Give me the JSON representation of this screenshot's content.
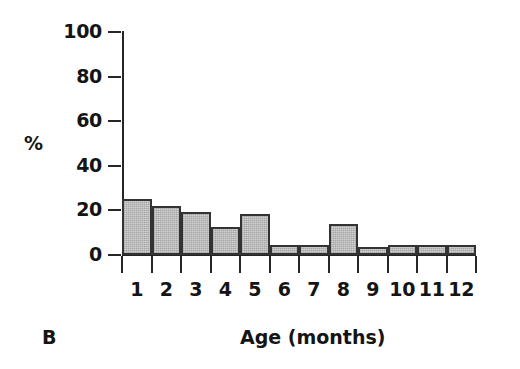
{
  "chart_data": {
    "type": "bar",
    "title": "",
    "panel_label": "B",
    "xlabel": "Age (months)",
    "ylabel": "%",
    "categories": [
      "1",
      "2",
      "3",
      "4",
      "5",
      "6",
      "7",
      "8",
      "9",
      "10",
      "11",
      "12"
    ],
    "values": [
      25,
      22,
      19.5,
      12.5,
      18.5,
      4.5,
      4.5,
      14,
      3.5,
      4.5,
      4.5,
      4.5
    ],
    "ylim": [
      0,
      100
    ],
    "yticks": [
      0,
      20,
      40,
      60,
      80,
      100
    ],
    "ytick_labels": [
      "0",
      "20",
      "40",
      "60",
      "80",
      "100"
    ],
    "xlim_categories": 12,
    "grid": false,
    "legend": null,
    "bar_fill_color": "#c6c6c6",
    "bar_edge_color": "#333333",
    "axis_color": "#262626",
    "background_color": "#ffffff"
  }
}
